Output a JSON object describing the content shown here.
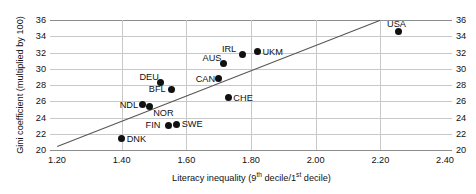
{
  "chart_data": {
    "type": "scatter",
    "title": "",
    "xlabel": "Literacy inequality (9th decile/1st decile)",
    "xlabel_parts": {
      "prefix": "Literacy inequality (9",
      "sup1": "th",
      "middle": " decile/1",
      "sup2": "st",
      "suffix": " decile)"
    },
    "ylabel": "Gini coefficient (multiplied by 100)",
    "xlim": [
      1.2,
      2.4
    ],
    "ylim": [
      20,
      36
    ],
    "xticks": [
      "1.20",
      "1.40",
      "1.60",
      "1.80",
      "2.00",
      "2.20",
      "2.40"
    ],
    "xtick_values": [
      1.2,
      1.4,
      1.6,
      1.8,
      2.0,
      2.2,
      2.4
    ],
    "yticks": [
      "36",
      "34",
      "32",
      "30",
      "28",
      "26",
      "24",
      "22",
      "20"
    ],
    "ytick_values": [
      36,
      34,
      32,
      30,
      28,
      26,
      24,
      22,
      20
    ],
    "grid": "both",
    "legend": "none",
    "y_axis_duplicated_right": true,
    "points": [
      {
        "label": "USA",
        "x": 2.255,
        "y": 34.55,
        "label_pos": "above"
      },
      {
        "label": "UKM",
        "x": 1.82,
        "y": 32.1,
        "label_pos": "right"
      },
      {
        "label": "IRL",
        "x": 1.775,
        "y": 31.75,
        "label_pos": "above-left"
      },
      {
        "label": "AUS",
        "x": 1.715,
        "y": 30.6,
        "label_pos": "above-left"
      },
      {
        "label": "CAN",
        "x": 1.7,
        "y": 28.75,
        "label_pos": "left"
      },
      {
        "label": "DEU",
        "x": 1.52,
        "y": 28.25,
        "label_pos": "above-left"
      },
      {
        "label": "BFL",
        "x": 1.555,
        "y": 27.5,
        "label_pos": "left"
      },
      {
        "label": "CHE",
        "x": 1.73,
        "y": 26.45,
        "label_pos": "right"
      },
      {
        "label": "NDL",
        "x": 1.465,
        "y": 25.55,
        "label_pos": "left"
      },
      {
        "label": "NOR",
        "x": 1.485,
        "y": 25.4,
        "label_pos": "below-right"
      },
      {
        "label": "FIN",
        "x": 1.545,
        "y": 23.05,
        "label_pos": "left"
      },
      {
        "label": "SWE",
        "x": 1.57,
        "y": 23.15,
        "label_pos": "right"
      },
      {
        "label": "DNK",
        "x": 1.4,
        "y": 21.4,
        "label_pos": "right"
      }
    ],
    "trendline": {
      "x_start": 1.2,
      "y_start": 20.45,
      "x_end": 2.2,
      "y_end": 36.0
    }
  }
}
